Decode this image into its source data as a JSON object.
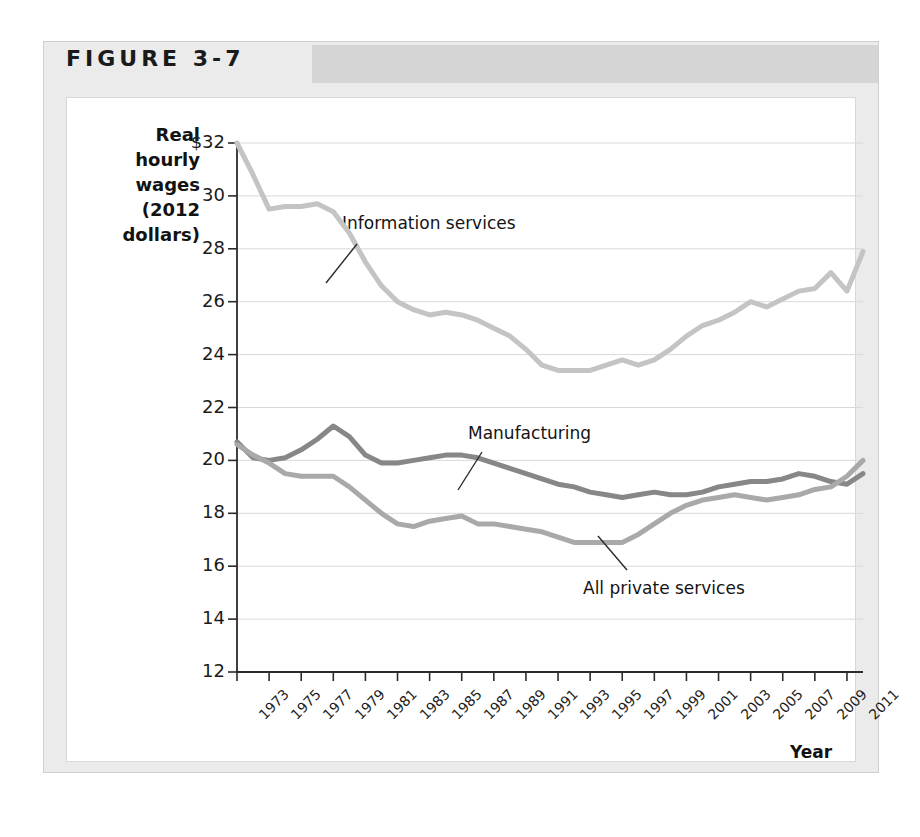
{
  "figure": {
    "title": "FIGURE 3-7"
  },
  "axes": {
    "y_title": "Real hourly wages (2012 dollars)",
    "y_title_lines": [
      "Real",
      "hourly",
      "wages",
      "(2012",
      "dollars)"
    ],
    "x_title": "Year",
    "y_ticks": [
      "$32",
      "30",
      "28",
      "26",
      "24",
      "22",
      "20",
      "18",
      "16",
      "14",
      "12"
    ],
    "x_ticks": [
      "1973",
      "1975",
      "1977",
      "1979",
      "1981",
      "1983",
      "1985",
      "1987",
      "1989",
      "1991",
      "1993",
      "1995",
      "1997",
      "1999",
      "2001",
      "2003",
      "2005",
      "2007",
      "2009",
      "2011"
    ]
  },
  "annotations": {
    "information_services": "Information services",
    "manufacturing": "Manufacturing",
    "all_private_services": "All private services"
  },
  "colors": {
    "information_services": "#c4c4c4",
    "all_private_services": "#a9a9a9",
    "manufacturing": "#878787",
    "gridline": "#d9d9d9",
    "axis": "#2b2b2b",
    "card_background": "#ebebeb",
    "header_band": "#d5d5d5",
    "panel_background": "#ffffff"
  },
  "chart_data": {
    "type": "line",
    "title": "FIGURE 3-7",
    "xlabel": "Year",
    "ylabel": "Real hourly wages (2012 dollars)",
    "xlim": [
      1973,
      2012
    ],
    "ylim": [
      12,
      32
    ],
    "ytick_step": 2,
    "grid": true,
    "legend": "inline-annotations",
    "x": [
      1973,
      1974,
      1975,
      1976,
      1977,
      1978,
      1979,
      1980,
      1981,
      1982,
      1983,
      1984,
      1985,
      1986,
      1987,
      1988,
      1989,
      1990,
      1991,
      1992,
      1993,
      1994,
      1995,
      1996,
      1997,
      1998,
      1999,
      2000,
      2001,
      2002,
      2003,
      2004,
      2005,
      2006,
      2007,
      2008,
      2009,
      2010,
      2011,
      2012
    ],
    "series": [
      {
        "name": "Information services",
        "color": "#c4c4c4",
        "values": [
          32.0,
          30.8,
          29.5,
          29.6,
          29.6,
          29.7,
          29.4,
          28.6,
          27.5,
          26.6,
          26.0,
          25.7,
          25.5,
          25.6,
          25.5,
          25.3,
          25.0,
          24.7,
          24.2,
          23.6,
          23.4,
          23.4,
          23.4,
          23.6,
          23.8,
          23.6,
          23.8,
          24.2,
          24.7,
          25.1,
          25.3,
          25.6,
          26.0,
          25.8,
          26.1,
          26.4,
          26.5,
          27.1,
          26.4,
          27.9
        ]
      },
      {
        "name": "Manufacturing",
        "color": "#878787",
        "values": [
          20.7,
          20.1,
          20.0,
          20.1,
          20.4,
          20.8,
          21.3,
          20.9,
          20.2,
          19.9,
          19.9,
          20.0,
          20.1,
          20.2,
          20.2,
          20.1,
          19.9,
          19.7,
          19.5,
          19.3,
          19.1,
          19.0,
          18.8,
          18.7,
          18.6,
          18.7,
          18.8,
          18.7,
          18.7,
          18.8,
          19.0,
          19.1,
          19.2,
          19.2,
          19.3,
          19.5,
          19.4,
          19.2,
          19.1,
          19.5
        ]
      },
      {
        "name": "All private services",
        "color": "#a9a9a9",
        "values": [
          20.6,
          20.2,
          19.9,
          19.5,
          19.4,
          19.4,
          19.4,
          19.0,
          18.5,
          18.0,
          17.6,
          17.5,
          17.7,
          17.8,
          17.9,
          17.6,
          17.6,
          17.5,
          17.4,
          17.3,
          17.1,
          16.9,
          16.9,
          16.9,
          16.9,
          17.2,
          17.6,
          18.0,
          18.3,
          18.5,
          18.6,
          18.7,
          18.6,
          18.5,
          18.6,
          18.7,
          18.9,
          19.0,
          19.4,
          20.0
        ]
      }
    ]
  }
}
